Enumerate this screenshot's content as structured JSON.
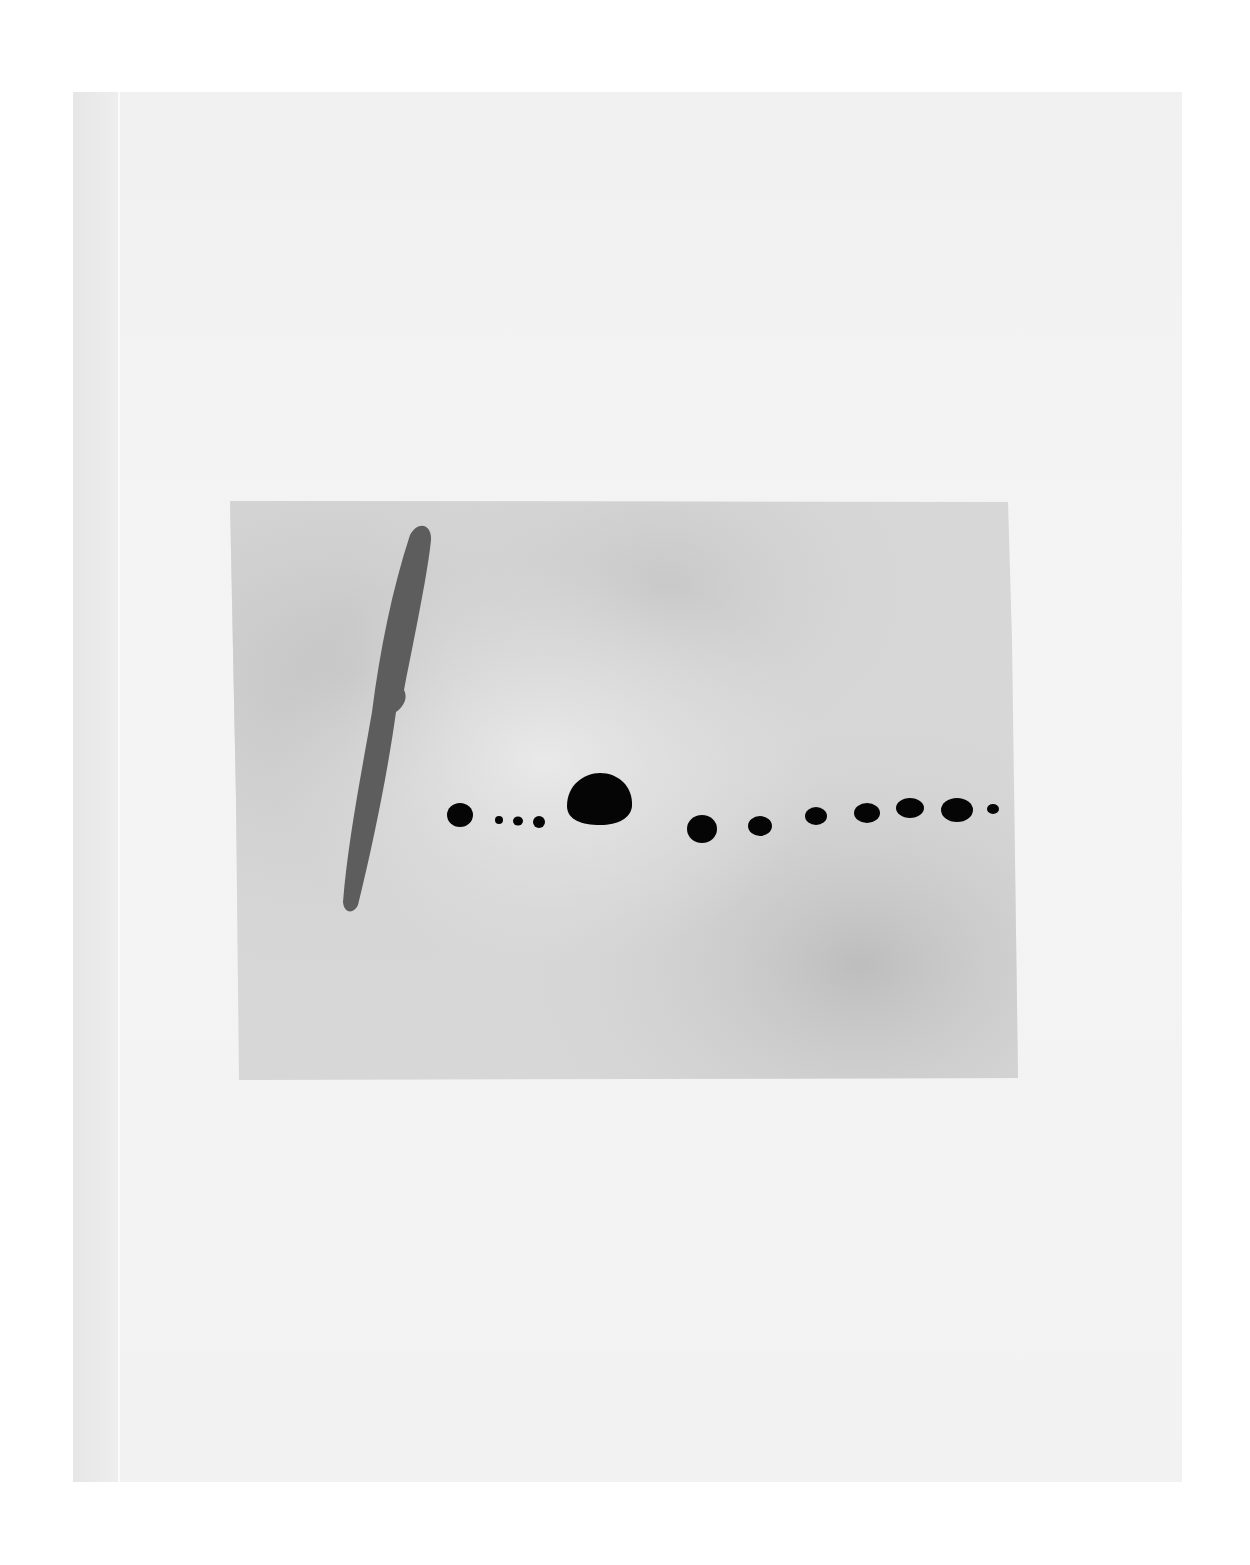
{
  "artwork": {
    "description": "Abstract watercolor: gray wash rectangle on white paper with a diagonal dark-gray brushstroke and a horizontal row of black dots",
    "colors": {
      "background": "#ffffff",
      "paper": "#f2f2f2",
      "wash": "#cfcfcf",
      "stroke": "#5a5a5a",
      "dots": "#050505"
    },
    "dots_count": 14
  }
}
